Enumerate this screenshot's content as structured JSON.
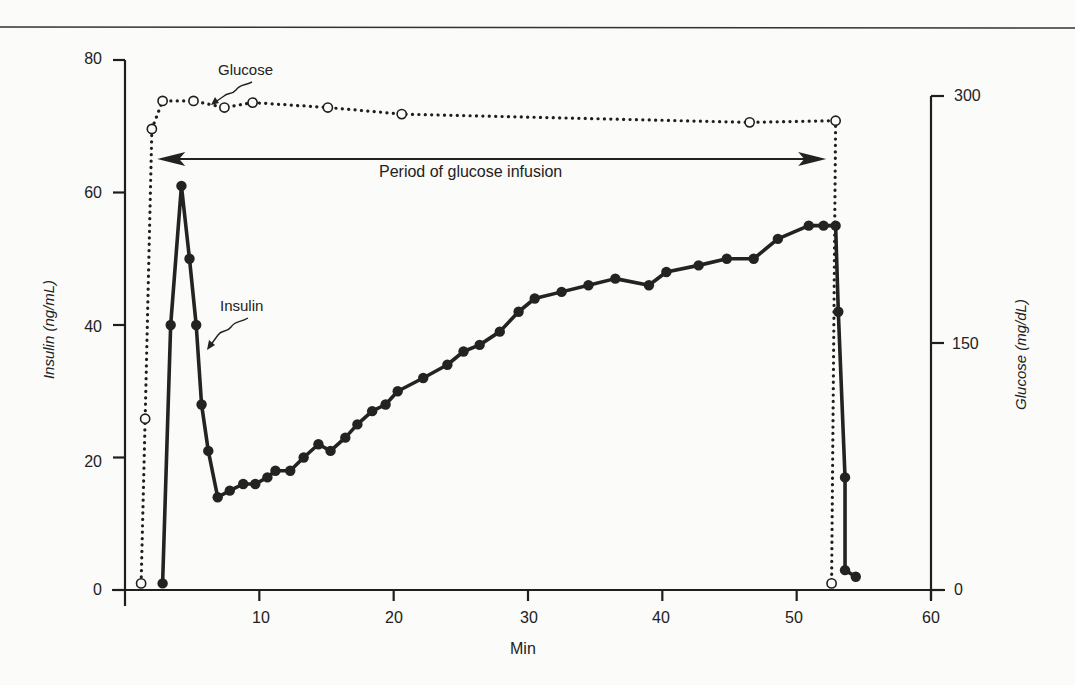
{
  "chart_data": {
    "type": "line",
    "title": "",
    "xlabel": "Min",
    "ylabel": "Insulin (ng/mL)",
    "y2label": "Glucose (mg/dL)",
    "xlim": [
      0,
      60
    ],
    "ylim": [
      0,
      80
    ],
    "y2lim": [
      0,
      300
    ],
    "x_ticks": [
      10,
      20,
      30,
      40,
      50,
      60
    ],
    "y_ticks": [
      0,
      20,
      40,
      60,
      80
    ],
    "y2_ticks": [
      0,
      150,
      300
    ],
    "grid": false,
    "legend": "none (inline annotations)",
    "series": [
      {
        "name": "Insulin",
        "axis": "left",
        "style": "solid line, filled circles",
        "x": [
          2.8,
          3.4,
          4.2,
          4.8,
          5.3,
          5.7,
          6.2,
          6.9,
          7.8,
          8.8,
          9.7,
          10.6,
          11.2,
          12.3,
          13.3,
          14.4,
          15.3,
          16.4,
          17.3,
          18.4,
          19.4,
          20.3,
          22.2,
          24.0,
          25.2,
          26.4,
          27.9,
          29.3,
          30.5,
          32.5,
          34.5,
          36.5,
          39.0,
          40.3,
          42.7,
          44.8,
          46.8,
          48.6,
          50.9,
          52.0,
          52.9,
          53.1,
          53.6,
          53.6,
          54.4
        ],
        "y": [
          1,
          40,
          61,
          50,
          40,
          28,
          21,
          14,
          15,
          16,
          16,
          17,
          18,
          18,
          20,
          22,
          21,
          23,
          25,
          27,
          28,
          30,
          32,
          34,
          36,
          37,
          39,
          42,
          44,
          45,
          46,
          47,
          46,
          48,
          49,
          50,
          50,
          53,
          55,
          55,
          55,
          42,
          17,
          3,
          2
        ]
      },
      {
        "name": "Glucose",
        "axis": "right",
        "style": "dotted line, open circles",
        "x": [
          1.2,
          1.5,
          2.0,
          2.8,
          5.1,
          7.4,
          9.5,
          15.1,
          20.6,
          46.5,
          52.9,
          52.6
        ],
        "y": [
          4,
          104,
          280,
          297,
          297,
          293,
          296,
          293,
          289,
          284,
          285,
          4
        ]
      }
    ],
    "annotations": [
      {
        "text": "Glucose",
        "points_to": "Glucose series"
      },
      {
        "text": "Insulin",
        "points_to": "Insulin series"
      },
      {
        "text": "Period of glucose infusion",
        "type": "double-arrow",
        "x_range": [
          2.4,
          52.2
        ]
      }
    ]
  },
  "labels": {
    "xlabel": "Min",
    "ylabel": "Insulin (ng/mL)",
    "y2label": "Glucose (mg/dL)",
    "glucose_annot": "Glucose",
    "insulin_annot": "Insulin",
    "period_annot": "Period of glucose infusion",
    "xticks": [
      "10",
      "20",
      "30",
      "40",
      "50",
      "60"
    ],
    "yticks": [
      "80",
      "60",
      "40",
      "20",
      "0"
    ],
    "y2ticks": [
      "300",
      "150",
      "0"
    ]
  }
}
